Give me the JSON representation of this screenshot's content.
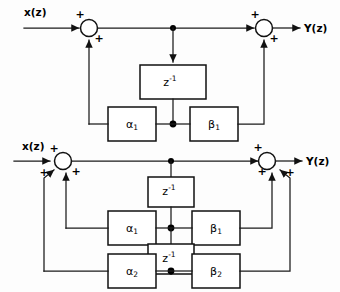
{
  "figure": {
    "background_color": "#fdfdfd",
    "line_color": "#111111",
    "diagram_count": 2
  },
  "diagrams": [
    {
      "id": "first-order",
      "order": "1",
      "input_label": "x(z)",
      "output_label": "Y(z)",
      "delay_blocks": [
        {
          "name": "delay-1",
          "label_base": "z",
          "label_exp": "-1"
        }
      ],
      "gain_blocks": [
        {
          "name": "alpha-1",
          "symbol": "α",
          "subscript": "1"
        },
        {
          "name": "beta-1",
          "symbol": "β",
          "subscript": "1"
        }
      ],
      "summing_nodes": [
        {
          "name": "input-adder",
          "signs": [
            "+",
            "+"
          ]
        },
        {
          "name": "output-adder",
          "signs": [
            "+",
            "+"
          ]
        }
      ],
      "sign_symbol": "+"
    },
    {
      "id": "second-order",
      "order": "2",
      "input_label": "x(z)",
      "output_label": "Y(z)",
      "delay_blocks": [
        {
          "name": "delay-1",
          "label_base": "z",
          "label_exp": "-1"
        },
        {
          "name": "delay-2",
          "label_base": "z",
          "label_exp": "-1"
        }
      ],
      "gain_blocks": [
        {
          "name": "alpha-1",
          "symbol": "α",
          "subscript": "1"
        },
        {
          "name": "beta-1",
          "symbol": "β",
          "subscript": "1"
        },
        {
          "name": "alpha-2",
          "symbol": "α",
          "subscript": "2"
        },
        {
          "name": "beta-2",
          "symbol": "β",
          "subscript": "2"
        }
      ],
      "summing_nodes": [
        {
          "name": "input-adder",
          "signs": [
            "+",
            "+",
            "+"
          ]
        },
        {
          "name": "output-adder",
          "signs": [
            "+",
            "+",
            "+"
          ]
        }
      ],
      "sign_symbol": "+"
    }
  ],
  "labels": {
    "input_top": "x(z)",
    "output_top": "Y(z)",
    "input_bottom": "x(z)",
    "output_bottom": "Y(z)",
    "delay_base": "z",
    "delay_exponent": "-1",
    "alpha": "α",
    "beta": "β",
    "sub_1": "1",
    "sub_2": "2",
    "plus": "+"
  }
}
